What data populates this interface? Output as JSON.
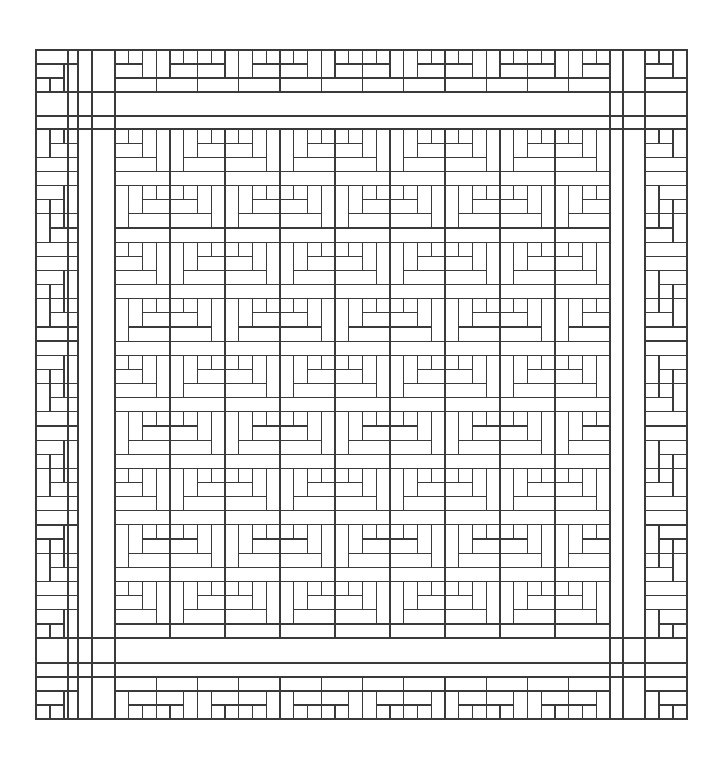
{
  "diagram": {
    "type": "quilt-pattern",
    "style": {
      "line_color": "#3a3a3a",
      "background": "#ffffff"
    },
    "outer": {
      "x0": 36,
      "y0": 50,
      "x1": 687,
      "y1": 719
    },
    "frame_lines": {
      "vertical": [
        68,
        78,
        92,
        115,
        610,
        623,
        645
      ],
      "horizontal": [
        92,
        116,
        129,
        638,
        663,
        677
      ]
    },
    "center_grid": {
      "x0": 115,
      "y0": 129,
      "x1": 610,
      "y1": 638,
      "cols": 9,
      "rows": 9,
      "pattern": "checkerboard",
      "block_types": [
        "log-cabin-corner-top-left",
        "log-cabin-corner-top-right"
      ]
    },
    "borders": {
      "top": {
        "x0": 115,
        "x1": 610,
        "y0": 50,
        "y1": 92,
        "blocks": 12
      },
      "bottom": {
        "x0": 115,
        "x1": 610,
        "y0": 677,
        "y1": 719,
        "blocks": 12
      },
      "left": {
        "x0": 36,
        "x1": 78,
        "y0": 129,
        "y1": 638,
        "blocks": 12
      },
      "right": {
        "x0": 645,
        "x1": 687,
        "y0": 129,
        "y1": 638,
        "blocks": 12
      }
    },
    "corners": {
      "top_left": {
        "x0": 36,
        "y0": 50,
        "x1": 78,
        "y1": 92
      },
      "top_right": {
        "x0": 645,
        "y0": 50,
        "x1": 687,
        "y1": 92
      },
      "bottom_left": {
        "x0": 36,
        "y0": 677,
        "x1": 78,
        "y1": 719
      },
      "bottom_right": {
        "x0": 645,
        "y0": 677,
        "x1": 687,
        "y1": 719
      }
    }
  }
}
